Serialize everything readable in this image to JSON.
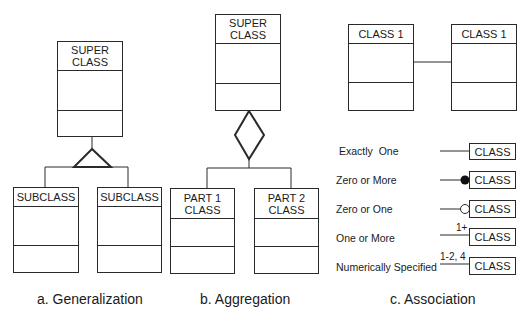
{
  "generalization": {
    "superclass": "SUPER\nCLASS",
    "subclasses": [
      "SUBCLASS",
      "SUBCLASS"
    ],
    "caption": "a. Generalization"
  },
  "aggregation": {
    "superclass": "SUPER\nCLASS",
    "parts": [
      "PART 1\nCLASS",
      "PART 2\nCLASS"
    ],
    "caption": "b. Aggregation"
  },
  "association": {
    "classes": [
      "CLASS 1",
      "CLASS 1"
    ],
    "caption": "c. Association",
    "multiplicities": [
      {
        "label": "Exactly  One",
        "symbol": "line",
        "annotation": "",
        "class": "CLASS"
      },
      {
        "label": "Zero or More",
        "symbol": "filled-circle",
        "annotation": "",
        "class": "CLASS"
      },
      {
        "label": "Zero or One",
        "symbol": "hollow-circle",
        "annotation": "",
        "class": "CLASS"
      },
      {
        "label": "One or More",
        "symbol": "line",
        "annotation": "1+",
        "class": "CLASS"
      },
      {
        "label": "Numerically Specified",
        "symbol": "line",
        "annotation": "1-2, 4",
        "class": "CLASS"
      }
    ]
  },
  "colors": {
    "stroke": "#2a2a2a",
    "background": "#ffffff"
  }
}
